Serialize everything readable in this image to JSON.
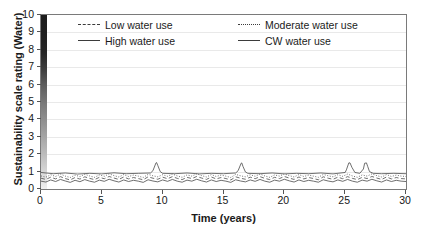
{
  "chart_data": {
    "type": "line",
    "title": "",
    "xlabel": "Time (years)",
    "ylabel": "Sustainability scale rating (Water)",
    "xlim": [
      0,
      30
    ],
    "ylim": [
      0,
      10
    ],
    "xticks": [
      "0",
      "5",
      "10",
      "15",
      "20",
      "25",
      "30"
    ],
    "yticks": [
      "0",
      "1",
      "2",
      "3",
      "4",
      "5",
      "6",
      "7",
      "8",
      "9",
      "10"
    ],
    "grid": "horizontal",
    "legend_position": "top-inside",
    "legend": [
      {
        "label": "Low water use",
        "style": "dashed"
      },
      {
        "label": "Moderate water use",
        "style": "dotted"
      },
      {
        "label": "High water use",
        "style": "solid"
      },
      {
        "label": "CW water use",
        "style": "solid"
      }
    ],
    "annotations": [
      {
        "text": "sustainability gradient bar",
        "location": "left axis, dark at 10 to light at 0"
      }
    ],
    "series": [
      {
        "name": "Low water use",
        "style": "dashed",
        "x": [
          0.0,
          0.4,
          0.8,
          1.2,
          1.6,
          2.0,
          2.4,
          2.8,
          3.2,
          3.6,
          4.0,
          4.4,
          4.8,
          5.2,
          5.6,
          6.0,
          6.4,
          6.8,
          7.2,
          7.6,
          8.0,
          8.4,
          8.8,
          9.2,
          9.6,
          10.0,
          10.4,
          10.8,
          11.2,
          11.6,
          12.0,
          12.4,
          12.8,
          13.2,
          13.6,
          14.0,
          14.4,
          14.8,
          15.2,
          15.6,
          16.0,
          16.4,
          16.8,
          17.2,
          17.6,
          18.0,
          18.4,
          18.8,
          19.2,
          19.6,
          20.0,
          20.4,
          20.8,
          21.2,
          21.6,
          22.0,
          22.4,
          22.8,
          23.2,
          23.6,
          24.0,
          24.4,
          24.8,
          25.2,
          25.6,
          26.0,
          26.4,
          26.8,
          27.2,
          27.6,
          28.0,
          28.4,
          28.8,
          29.2,
          29.6,
          30.0
        ],
        "y": [
          0.62,
          0.55,
          0.68,
          0.58,
          0.71,
          0.6,
          0.52,
          0.66,
          0.57,
          0.7,
          0.61,
          0.54,
          0.67,
          0.59,
          0.72,
          0.63,
          0.55,
          0.69,
          0.58,
          0.66,
          0.6,
          0.53,
          0.7,
          0.62,
          0.56,
          0.68,
          0.59,
          0.71,
          0.61,
          0.54,
          0.67,
          0.6,
          0.72,
          0.63,
          0.55,
          0.69,
          0.58,
          0.66,
          0.6,
          0.52,
          0.7,
          0.62,
          0.56,
          0.68,
          0.59,
          0.71,
          0.61,
          0.54,
          0.67,
          0.6,
          0.72,
          0.63,
          0.55,
          0.69,
          0.58,
          0.66,
          0.6,
          0.53,
          0.7,
          0.62,
          0.56,
          0.68,
          0.59,
          0.71,
          0.61,
          0.54,
          0.67,
          0.6,
          0.72,
          0.63,
          0.55,
          0.69,
          0.58,
          0.66,
          0.6,
          0.58
        ]
      },
      {
        "name": "Moderate water use",
        "style": "dotted",
        "x": [
          0.0,
          0.4,
          0.8,
          1.2,
          1.6,
          2.0,
          2.4,
          2.8,
          3.2,
          3.6,
          4.0,
          4.4,
          4.8,
          5.2,
          5.6,
          6.0,
          6.4,
          6.8,
          7.2,
          7.6,
          8.0,
          8.4,
          8.8,
          9.2,
          9.6,
          10.0,
          10.4,
          10.8,
          11.2,
          11.6,
          12.0,
          12.4,
          12.8,
          13.2,
          13.6,
          14.0,
          14.4,
          14.8,
          15.2,
          15.6,
          16.0,
          16.4,
          16.8,
          17.2,
          17.6,
          18.0,
          18.4,
          18.8,
          19.2,
          19.6,
          20.0,
          20.4,
          20.8,
          21.2,
          21.6,
          22.0,
          22.4,
          22.8,
          23.2,
          23.6,
          24.0,
          24.4,
          24.8,
          25.2,
          25.6,
          26.0,
          26.4,
          26.8,
          27.2,
          27.6,
          28.0,
          28.4,
          28.8,
          29.2,
          29.6,
          30.0
        ],
        "y": [
          0.75,
          0.68,
          0.82,
          0.72,
          0.86,
          0.74,
          0.66,
          0.8,
          0.71,
          0.85,
          0.75,
          0.67,
          0.81,
          0.73,
          0.87,
          0.77,
          0.69,
          0.83,
          0.72,
          0.8,
          0.74,
          0.66,
          0.84,
          0.76,
          0.7,
          0.82,
          0.73,
          0.86,
          0.75,
          0.67,
          0.81,
          0.74,
          0.87,
          0.77,
          0.69,
          0.83,
          0.72,
          0.8,
          0.74,
          0.66,
          0.84,
          0.76,
          0.7,
          0.82,
          0.73,
          0.86,
          0.75,
          0.67,
          0.81,
          0.74,
          0.87,
          0.77,
          0.69,
          0.83,
          0.72,
          0.8,
          0.74,
          0.67,
          0.84,
          0.76,
          0.7,
          0.82,
          0.73,
          0.86,
          0.75,
          0.67,
          0.81,
          0.74,
          0.87,
          0.77,
          0.69,
          0.83,
          0.72,
          0.8,
          0.74,
          0.72
        ]
      },
      {
        "name": "High water use",
        "style": "solid",
        "x": [
          0.0,
          0.4,
          0.8,
          1.2,
          1.6,
          2.0,
          2.4,
          2.8,
          3.2,
          3.6,
          4.0,
          4.4,
          4.8,
          5.2,
          5.6,
          6.0,
          6.4,
          6.8,
          7.2,
          7.6,
          8.0,
          8.4,
          8.8,
          9.2,
          9.6,
          10.0,
          10.4,
          10.8,
          11.2,
          11.6,
          12.0,
          12.4,
          12.8,
          13.2,
          13.6,
          14.0,
          14.4,
          14.8,
          15.2,
          15.6,
          16.0,
          16.4,
          16.8,
          17.2,
          17.6,
          18.0,
          18.4,
          18.8,
          19.2,
          19.6,
          20.0,
          20.4,
          20.8,
          21.2,
          21.6,
          22.0,
          22.4,
          22.8,
          23.2,
          23.6,
          24.0,
          24.4,
          24.8,
          25.2,
          25.6,
          26.0,
          26.4,
          26.8,
          27.2,
          27.6,
          28.0,
          28.4,
          28.8,
          29.2,
          29.6,
          30.0
        ],
        "y": [
          0.45,
          0.4,
          0.52,
          0.43,
          0.55,
          0.46,
          0.38,
          0.5,
          0.42,
          0.54,
          0.45,
          0.39,
          0.51,
          0.44,
          0.56,
          0.47,
          0.4,
          0.52,
          0.43,
          0.5,
          0.45,
          0.38,
          0.53,
          0.46,
          0.41,
          0.52,
          0.44,
          0.55,
          0.45,
          0.39,
          0.51,
          0.45,
          0.56,
          0.47,
          0.4,
          0.52,
          0.43,
          0.5,
          0.45,
          0.38,
          0.53,
          0.46,
          0.41,
          0.52,
          0.44,
          0.55,
          0.45,
          0.39,
          0.51,
          0.45,
          0.56,
          0.47,
          0.4,
          0.52,
          0.43,
          0.5,
          0.45,
          0.39,
          0.53,
          0.46,
          0.41,
          0.52,
          0.44,
          0.55,
          0.45,
          0.39,
          0.51,
          0.45,
          0.56,
          0.47,
          0.4,
          0.52,
          0.43,
          0.5,
          0.45,
          0.43
        ]
      },
      {
        "name": "CW water use",
        "style": "solid",
        "note": "near-flat baseline with four tall transient spikes",
        "x": [
          0.0,
          1.0,
          2.0,
          3.0,
          4.0,
          5.0,
          6.0,
          7.0,
          8.0,
          9.0,
          9.2,
          9.45,
          9.5,
          9.6,
          9.8,
          10.0,
          11.0,
          12.0,
          13.0,
          14.0,
          15.0,
          16.0,
          16.2,
          16.45,
          16.5,
          16.6,
          16.8,
          17.0,
          18.0,
          19.0,
          20.0,
          21.0,
          22.0,
          23.0,
          24.0,
          25.0,
          25.1,
          25.3,
          25.4,
          25.55,
          25.8,
          26.2,
          26.5,
          26.6,
          26.75,
          26.85,
          27.0,
          27.3,
          28.0,
          29.0,
          30.0
        ],
        "y": [
          0.95,
          0.88,
          0.92,
          0.86,
          0.9,
          0.87,
          0.93,
          0.88,
          0.9,
          0.92,
          1.05,
          1.5,
          1.52,
          1.35,
          1.0,
          0.9,
          0.88,
          0.92,
          0.87,
          0.9,
          0.88,
          0.92,
          1.05,
          1.48,
          1.5,
          1.3,
          0.98,
          0.9,
          0.88,
          0.92,
          0.87,
          0.9,
          0.88,
          0.92,
          0.87,
          0.95,
          1.1,
          1.5,
          1.5,
          1.25,
          0.95,
          0.9,
          1.15,
          1.48,
          1.5,
          1.3,
          1.0,
          0.9,
          0.88,
          0.9,
          0.88
        ]
      }
    ]
  }
}
